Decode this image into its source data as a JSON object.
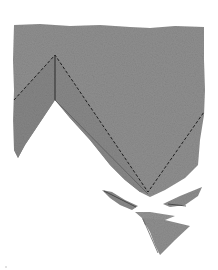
{
  "scene": {
    "description": "Torn grey paper sheet with dashed fold lines forming a zigzag and broken triangular shards below",
    "colors": {
      "background": "#ffffff",
      "paper": "#8f8f8f",
      "paper_dark": "#7d7d7d",
      "paper_light": "#a3a3a3",
      "fold_line": "#1e1e1e"
    },
    "elements": {
      "main_sheet": "torn-grey-paper-sheet",
      "fold_lines": "dashed-zigzag-fold-line",
      "crease": "solid-vertical-crease",
      "shards": [
        "shard-left",
        "shard-right",
        "shard-bottom-large",
        "shard-bottom-small"
      ]
    }
  }
}
